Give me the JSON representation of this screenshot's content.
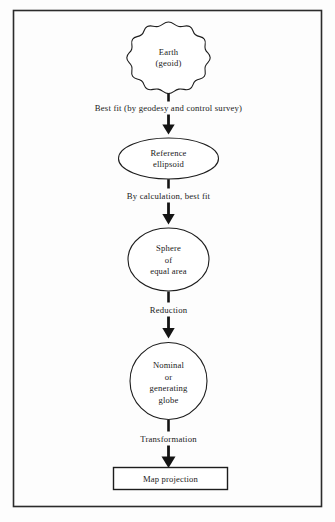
{
  "figure": {
    "background_color": "#fdfdfd",
    "frame_color": "#2b2b2b",
    "ink_color": "#141414"
  },
  "nodes": [
    {
      "id": "earth-geoid",
      "shape": "geoid-lobed-circle",
      "lines": [
        "Earth",
        "(geoid)"
      ],
      "line1": "Earth",
      "line2": "(geoid)"
    },
    {
      "id": "reference-ellipsoid",
      "shape": "ellipse",
      "lines": [
        "Reference",
        "ellipsoid"
      ],
      "line1": "Reference",
      "line2": "ellipsoid"
    },
    {
      "id": "sphere-equal-area",
      "shape": "circle",
      "lines": [
        "Sphere",
        "of",
        "equal  area"
      ],
      "line1": "Sphere",
      "line2": "of",
      "line3": "equal  area"
    },
    {
      "id": "nominal-generating-globe",
      "shape": "circle",
      "lines": [
        "Nominal",
        "or",
        "generating",
        "globe"
      ],
      "line1": "Nominal",
      "line2": "or",
      "line3": "generating",
      "line4": "globe"
    },
    {
      "id": "map-projection",
      "shape": "rectangle",
      "lines": [
        "Map projection"
      ],
      "line1": "Map projection"
    }
  ],
  "edges": [
    {
      "id": "edge-geoid-to-ellipsoid",
      "label": "Best fit (by geodesy and control survey)",
      "from": "earth-geoid",
      "to": "reference-ellipsoid"
    },
    {
      "id": "edge-ellipsoid-to-sphere",
      "label": "By calculation, best fit",
      "from": "reference-ellipsoid",
      "to": "sphere-equal-area"
    },
    {
      "id": "edge-sphere-to-globe",
      "label": "Reduction",
      "from": "sphere-equal-area",
      "to": "nominal-generating-globe"
    },
    {
      "id": "edge-globe-to-projection",
      "label": "Transformation",
      "from": "nominal-generating-globe",
      "to": "map-projection"
    }
  ]
}
